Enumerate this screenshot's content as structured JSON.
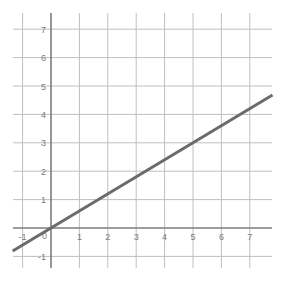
{
  "chart_data": {
    "type": "line",
    "title": "",
    "subtitle": "",
    "xlabel": "",
    "ylabel": "",
    "xlim": [
      -1.35,
      7.8
    ],
    "ylim": [
      -1.4,
      7.55
    ],
    "grid": true,
    "legend": false,
    "legend_position": "none",
    "background_color": "#ffffff",
    "grid_color": "#bfbfbf",
    "axis_color": "#7d7d7d",
    "line_color": "#6b6b6b",
    "line_width": 3,
    "xticks": [
      -1,
      0,
      1,
      2,
      3,
      4,
      5,
      6,
      7
    ],
    "yticks": [
      -1,
      0,
      1,
      2,
      3,
      4,
      5,
      6,
      7
    ],
    "xtick_labels": [
      "-1",
      "0",
      "1",
      "2",
      "3",
      "4",
      "5",
      "6",
      "7"
    ],
    "ytick_labels": [
      "-1",
      "0",
      "1",
      "2",
      "3",
      "4",
      "5",
      "6",
      "7"
    ],
    "origin_label": "0",
    "series": [
      {
        "name": "line",
        "type": "line",
        "slope": 0.6,
        "intercept": 0,
        "equation": "y = 0.6x",
        "x": [
          -1.35,
          7.8
        ],
        "values": [
          -0.81,
          4.68
        ],
        "points": [
          {
            "x": -1.35,
            "y": -0.81
          },
          {
            "x": 0,
            "y": 0
          },
          {
            "x": 5,
            "y": 3
          },
          {
            "x": 7.8,
            "y": 4.68
          }
        ]
      }
    ]
  },
  "axes": {
    "x_axis_name": "x-axis",
    "y_axis_name": "y-axis"
  }
}
